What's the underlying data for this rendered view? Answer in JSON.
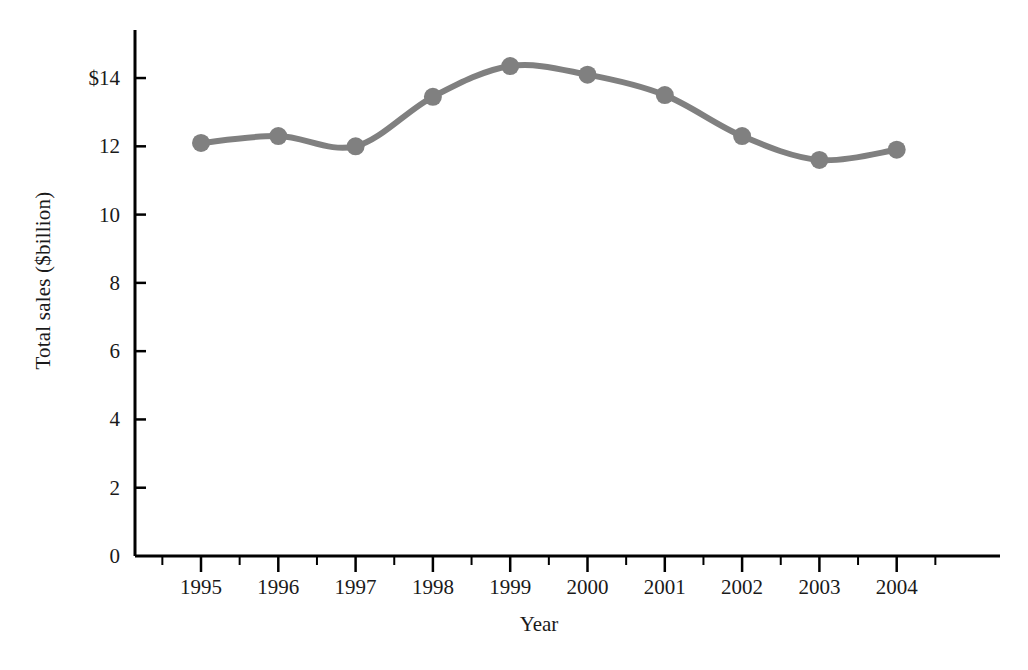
{
  "chart_data": {
    "type": "line",
    "title": "",
    "xlabel": "Year",
    "ylabel": "Total sales ($billion)",
    "categories": [
      "1995",
      "1996",
      "1997",
      "1998",
      "1999",
      "2000",
      "2001",
      "2002",
      "2003",
      "2004"
    ],
    "values": [
      12.1,
      12.3,
      12.0,
      13.45,
      14.35,
      14.1,
      13.5,
      12.3,
      11.6,
      11.9
    ],
    "series": [
      {
        "name": "Total sales",
        "values": [
          12.1,
          12.3,
          12.0,
          13.45,
          14.35,
          14.1,
          13.5,
          12.3,
          11.6,
          11.9
        ]
      }
    ],
    "ylim": [
      0,
      15
    ],
    "xlim": [
      "1995",
      "2004"
    ],
    "ytick_labels": [
      "0",
      "2",
      "4",
      "6",
      "8",
      "10",
      "12",
      "$14"
    ],
    "ytick_values": [
      0,
      2,
      4,
      6,
      8,
      10,
      12,
      14
    ],
    "xtick_labels": [
      "1995",
      "1996",
      "1997",
      "1998",
      "1999",
      "2000",
      "2001",
      "2002",
      "2003",
      "2004"
    ],
    "grid": false,
    "legend": "none",
    "line_color": "#808080",
    "marker_color": "#808080",
    "axis_color": "#000000",
    "background_color": "#ffffff",
    "line_width": 6,
    "marker_size": 9
  },
  "axes": {
    "y_title": "Total sales ($billion)",
    "x_title": "Year"
  }
}
